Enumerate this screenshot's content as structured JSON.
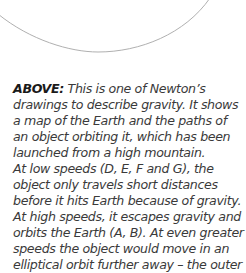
{
  "figure": {
    "stroke_color": "#b0b0b0"
  },
  "caption": {
    "label": "ABOVE:",
    "lines": [
      " This is one of Newton’s",
      "drawings to describe gravity. It shows",
      "a map of the Earth and the paths of",
      "an object orbiting it, which has been",
      "launched from a high mountain.",
      "At low speeds (D, E, F and G), the",
      "object only travels short distances",
      "before it hits Earth because of gravity.",
      "At high speeds, it escapes gravity and",
      "orbits the Earth (A, B). At even greater",
      "speeds the object would move in an",
      "elliptical orbit further away – the outer"
    ]
  }
}
